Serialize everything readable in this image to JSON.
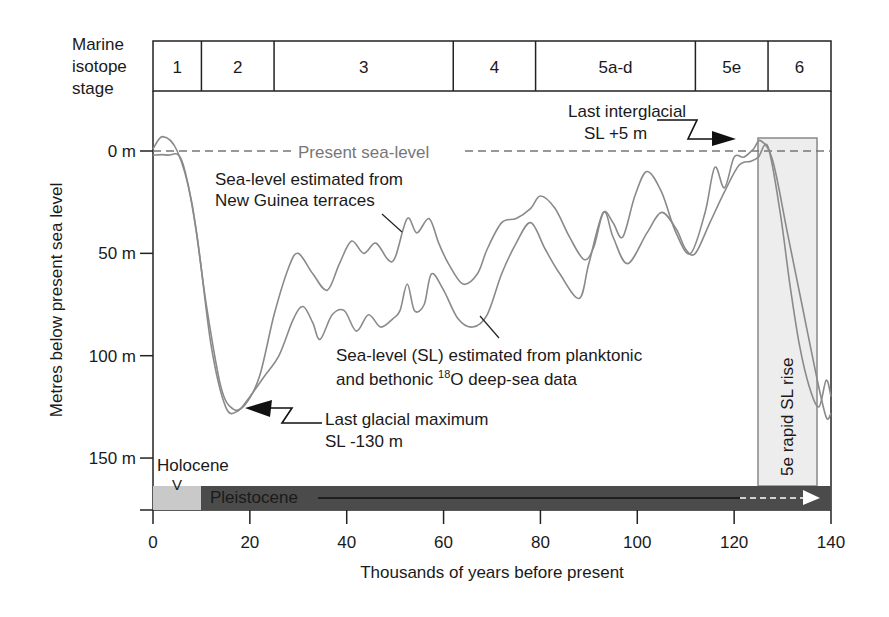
{
  "chart_data": {
    "type": "line",
    "title": "",
    "xlabel": "Thousands of years before present",
    "ylabel": "Metres below present sea level",
    "xlim": [
      0,
      140
    ],
    "ylim": [
      170,
      -10
    ],
    "x_ticks": [
      0,
      20,
      40,
      60,
      80,
      100,
      120,
      140
    ],
    "x_tick_labels": [
      "0",
      "20",
      "40",
      "60",
      "80",
      "100",
      "120",
      "140"
    ],
    "y_ticks": [
      0,
      50,
      100,
      150
    ],
    "y_tick_labels": [
      "0 m",
      "50 m",
      "100 m",
      "150 m"
    ],
    "grid": false,
    "isotope_stages": {
      "header": [
        "Marine",
        "isotope",
        "stage"
      ],
      "stages": [
        {
          "label": "1",
          "start": 0,
          "end": 10
        },
        {
          "label": "2",
          "start": 10,
          "end": 25
        },
        {
          "label": "3",
          "start": 25,
          "end": 62
        },
        {
          "label": "4",
          "start": 62,
          "end": 79
        },
        {
          "label": "5a-d",
          "start": 79,
          "end": 112
        },
        {
          "label": "5e",
          "start": 112,
          "end": 127
        },
        {
          "label": "6",
          "start": 127,
          "end": 140
        }
      ]
    },
    "present_sea_level": {
      "value": 0,
      "label": "Present sea-level"
    },
    "series": [
      {
        "name": "Sea-level estimated from New Guinea terraces",
        "x": [
          0,
          2,
          5,
          8,
          11,
          14,
          16.5,
          19,
          22,
          25,
          28,
          30,
          33,
          36,
          38.5,
          41,
          43.5,
          46,
          48.5,
          50,
          52.5,
          54.5,
          57,
          59,
          61,
          64,
          67,
          69,
          72,
          75,
          78,
          80,
          83,
          86,
          89,
          91,
          93,
          95,
          97,
          99.5,
          102,
          105,
          108,
          111,
          114,
          116,
          118,
          120,
          122,
          124,
          125.5,
          128,
          131,
          134,
          137,
          139,
          140
        ],
        "y": [
          -1,
          -7,
          0,
          25,
          75,
          115,
          126,
          124,
          110,
          80,
          57,
          50,
          60,
          68,
          55,
          44,
          50,
          45,
          53,
          52,
          33,
          40,
          33,
          45,
          55,
          65,
          60,
          48,
          35,
          33,
          28,
          22,
          28,
          42,
          53,
          47,
          30,
          35,
          42,
          22,
          10,
          20,
          40,
          50,
          30,
          8,
          18,
          3,
          3,
          -1,
          -5,
          5,
          40,
          75,
          110,
          130,
          128
        ]
      },
      {
        "name": "Sea-level (SL) estimated from planktonic and bethonic 18O deep-sea data",
        "x": [
          0,
          3,
          6,
          9,
          12,
          15,
          17.5,
          20,
          23,
          26,
          29,
          31,
          33,
          34.5,
          37,
          39.5,
          42,
          44.5,
          47,
          49.5,
          51,
          52.5,
          54,
          56,
          57.5,
          60,
          63,
          66,
          69,
          72,
          75,
          78,
          81,
          84,
          88,
          90,
          93,
          95,
          98,
          102,
          105,
          108,
          110,
          112,
          115,
          118,
          121,
          123.5,
          125,
          127,
          129.5,
          131.5,
          133.5,
          135.5,
          137.5,
          139,
          140
        ],
        "y": [
          2,
          2,
          5,
          40,
          95,
          125,
          127,
          120,
          110,
          100,
          82,
          76,
          84,
          92,
          80,
          78,
          88,
          80,
          86,
          82,
          78,
          65,
          78,
          75,
          60,
          68,
          82,
          86,
          80,
          60,
          45,
          35,
          48,
          60,
          72,
          55,
          30,
          42,
          55,
          40,
          30,
          38,
          48,
          50,
          35,
          20,
          7,
          5,
          3,
          -2,
          30,
          65,
          95,
          115,
          125,
          112,
          120
        ]
      }
    ],
    "annotations": [
      {
        "text": "Present sea-level",
        "x": 50,
        "y": 0
      },
      {
        "text": "Sea-level estimated from New Guinea terraces",
        "x": 13,
        "y": 15
      },
      {
        "text": "Sea-level (SL) estimated from planktonic and bethonic 18O deep-sea data",
        "x": 39,
        "y": 95
      },
      {
        "text": "Last glacial maximum SL -130 m",
        "x": 36,
        "y": 130,
        "arrow_to": [
          19,
          128
        ]
      },
      {
        "text": "Last interglacial SL +5 m",
        "x": 100,
        "y": -15,
        "arrow_to": [
          121,
          -3
        ]
      },
      {
        "text": "5e rapid SL rise",
        "x": 131,
        "y": 130,
        "rotated": true,
        "band": [
          125,
          137
        ]
      },
      {
        "text": "Holocene",
        "x": 1,
        "y": 153
      },
      {
        "text": "V",
        "x": 5,
        "y": 160
      },
      {
        "text": "Pleistocene",
        "x": 12,
        "y": 165
      }
    ],
    "epochs": [
      {
        "label": "Holocene",
        "start": 0,
        "end": 10,
        "color": "#c8c8c8"
      },
      {
        "label": "Pleistocene",
        "start": 10,
        "end": 140,
        "color": "#4a4a4a"
      }
    ]
  },
  "labels": {
    "stage_header": [
      "Marine",
      "isotope",
      "stage"
    ],
    "stages": [
      "1",
      "2",
      "3",
      "4",
      "5a-d",
      "5e",
      "6"
    ],
    "y_ticks": [
      "0 m",
      "50 m",
      "100 m",
      "150 m"
    ],
    "x_ticks": [
      "0",
      "20",
      "40",
      "60",
      "80",
      "100",
      "120",
      "140"
    ],
    "xlabel": "Thousands of years before present",
    "ylabel": "Metres below present sea level",
    "present_sea_level": "Present sea-level",
    "new_guinea": [
      "Sea-level estimated from",
      "New Guinea terraces"
    ],
    "deep_sea_line1": "Sea-level (SL) estimated from planktonic",
    "deep_sea_line2_pre": "and bethonic ",
    "deep_sea_sup": "18",
    "deep_sea_line2_post": "O deep-sea data",
    "lgm": [
      "Last glacial maximum",
      "SL -130 m"
    ],
    "lig": [
      "Last interglacial",
      "SL +5 m"
    ],
    "rapid_rise": "5e rapid SL rise",
    "holocene": "Holocene",
    "holocene_marker": "V",
    "pleistocene": "Pleistocene"
  },
  "colors": {
    "curve": "#8a8a8a",
    "axis": "#222222",
    "dashed": "#777777",
    "band_fill": "#ececec",
    "band_stroke": "#888888",
    "holocene_bar": "#c9c9c9",
    "pleistocene_bar": "#4b4b4b"
  }
}
